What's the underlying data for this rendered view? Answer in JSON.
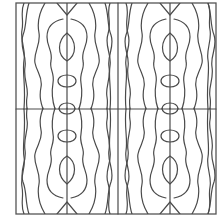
{
  "figure": {
    "kind": "symmetric line-art tile pattern",
    "stroke_color": "#4a4a4a",
    "background_color": "#ffffff",
    "frame": {
      "x": 16,
      "y": 3,
      "width": 200,
      "height": 211
    },
    "vertical_axes_x": [
      67,
      118,
      170
    ],
    "horizontal_axis_y": 109
  }
}
